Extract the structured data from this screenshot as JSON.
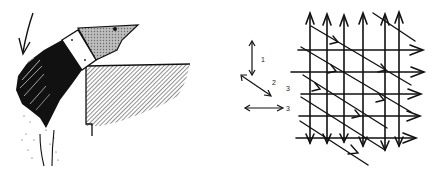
{
  "figure": {
    "left": {
      "title": "Brush applying paint to corner surface",
      "elements": [
        "stroke-direction-arrow",
        "brush-bristles",
        "brush-ferrule",
        "brush-handle",
        "painted-surface",
        "spatter"
      ]
    },
    "legend": {
      "items": [
        {
          "label": "1",
          "direction": "vertical"
        },
        {
          "label": "2",
          "direction": "diagonal"
        },
        {
          "label": "3",
          "direction": "horizontal"
        }
      ]
    },
    "grid": {
      "title": "Crossed stroke pattern",
      "vertical_strokes": 6,
      "horizontal_strokes": 5,
      "diagonal_strokes": 6
    },
    "colors": {
      "ink": "#111111",
      "hatch": "#8a8a8a",
      "background": "#ffffff"
    }
  }
}
